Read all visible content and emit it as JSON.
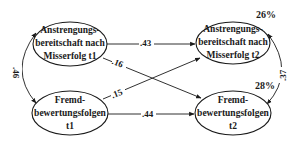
{
  "diagram": {
    "type": "path-model",
    "nodes": [
      {
        "id": "anstrengung_t1",
        "lines": [
          "Anstrengungs-",
          "bereitschaft nach",
          "Misserfolg t1"
        ]
      },
      {
        "id": "fremd_t1",
        "lines": [
          "Fremd-",
          "bewertungsfolgen",
          "t1"
        ]
      },
      {
        "id": "anstrengung_t2",
        "lines": [
          "Anstrengungs-",
          "bereitschaft nach",
          "Misserfolg t2"
        ],
        "r2": "26%"
      },
      {
        "id": "fremd_t2",
        "lines": [
          "Fremd-",
          "bewertungsfolgen",
          "t2"
        ],
        "r2": "28%"
      }
    ],
    "edges": [
      {
        "from": "anstrengung_t1",
        "to": "anstrengung_t2",
        "label": ".43"
      },
      {
        "from": "anstrengung_t1",
        "to": "fremd_t2",
        "label": ".16"
      },
      {
        "from": "fremd_t1",
        "to": "anstrengung_t2",
        "label": ".15"
      },
      {
        "from": "fremd_t1",
        "to": "fremd_t2",
        "label": ".44"
      },
      {
        "from": "anstrengung_t1",
        "to": "fremd_t1",
        "label": ".46",
        "type": "correlation"
      },
      {
        "from": "anstrengung_t2",
        "to": "fremd_t2",
        "label": ".37",
        "type": "correlation"
      }
    ]
  },
  "colors": {
    "line": "#1a1a1a",
    "background": "#ffffff"
  }
}
